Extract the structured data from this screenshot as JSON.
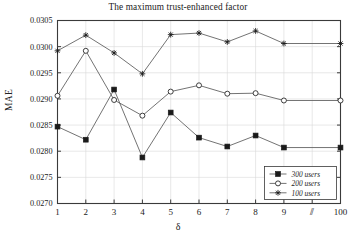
{
  "chart_data": {
    "type": "line",
    "title": "The maximum trust-enhanced factor",
    "xlabel": "δ",
    "ylabel": "MAE",
    "x": [
      1,
      2,
      3,
      4,
      5,
      6,
      7,
      8,
      9,
      100
    ],
    "categories": [
      "1",
      "2",
      "3",
      "4",
      "5",
      "6",
      "7",
      "8",
      "9",
      "100"
    ],
    "xtick_labels": [
      "1",
      "2",
      "3",
      "4",
      "5",
      "6",
      "7",
      "8",
      "9",
      "⫽",
      "100"
    ],
    "axis_break_symbol": "⫽",
    "ytick_labels": [
      "0.0270",
      "0.0275",
      "0.0280",
      "0.0285",
      "0.0290",
      "0.0295",
      "0.0300",
      "0.0305"
    ],
    "ytick_values": [
      0.027,
      0.0275,
      0.028,
      0.0285,
      0.029,
      0.0295,
      0.03,
      0.0305
    ],
    "ylim": [
      0.027,
      0.0305
    ],
    "grid": true,
    "legend_position": "lower-right",
    "series": [
      {
        "name": "300 users",
        "marker": "filled-square",
        "values": [
          0.02847,
          0.02822,
          0.02918,
          0.02788,
          0.02874,
          0.02826,
          0.02809,
          0.0283,
          0.02807,
          0.02807
        ]
      },
      {
        "name": "200 users",
        "marker": "open-circle",
        "values": [
          0.02906,
          0.02992,
          0.02898,
          0.02868,
          0.02914,
          0.02926,
          0.0291,
          0.02911,
          0.02897,
          0.02897
        ]
      },
      {
        "name": "100 users",
        "marker": "star",
        "values": [
          0.02992,
          0.03022,
          0.02988,
          0.02948,
          0.03023,
          0.03026,
          0.03009,
          0.0303,
          0.03006,
          0.03006
        ]
      }
    ]
  },
  "legend": {
    "items": [
      {
        "label": "300 users"
      },
      {
        "label": "200 users"
      },
      {
        "label": "100 users"
      }
    ]
  }
}
